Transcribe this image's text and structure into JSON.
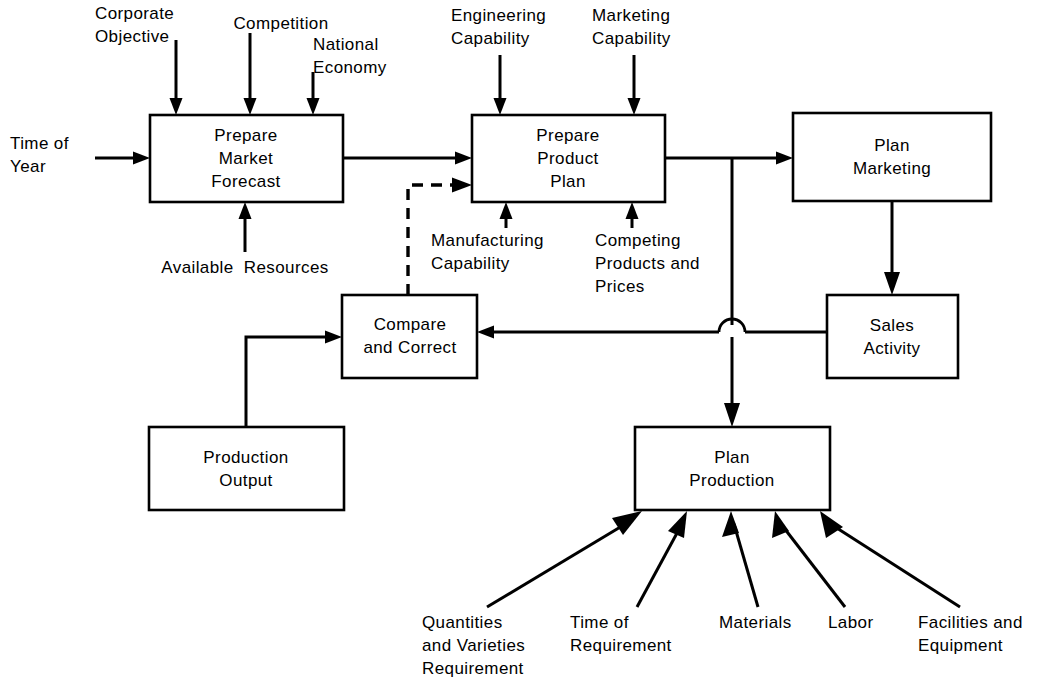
{
  "diagram": {
    "type": "flowchart",
    "stroke_color": "#000000",
    "background_color": "#ffffff",
    "process_boxes": [
      {
        "id": "prepare-market-forecast",
        "label": "Prepare\nMarket\nForecast"
      },
      {
        "id": "prepare-product-plan",
        "label": "Prepare\nProduct\nPlan"
      },
      {
        "id": "plan-marketing",
        "label": "Plan\nMarketing"
      },
      {
        "id": "sales-activity",
        "label": "Sales\nActivity"
      },
      {
        "id": "compare-and-correct",
        "label": "Compare\nand Correct"
      },
      {
        "id": "production-output",
        "label": "Production\nOutput"
      },
      {
        "id": "plan-production",
        "label": "Plan\nProduction"
      }
    ],
    "input_labels": [
      {
        "id": "corporate-objective",
        "label": "Corporate\nObjective",
        "target": "prepare-market-forecast"
      },
      {
        "id": "competition",
        "label": "Competition",
        "target": "prepare-market-forecast"
      },
      {
        "id": "national-economy",
        "label": "National\nEconomy",
        "target": "prepare-market-forecast"
      },
      {
        "id": "time-of-year",
        "label": "Time of\nYear",
        "target": "prepare-market-forecast"
      },
      {
        "id": "available-resources",
        "label": "Available  Resources",
        "target": "prepare-market-forecast"
      },
      {
        "id": "engineering-capability",
        "label": "Engineering\nCapability",
        "target": "prepare-product-plan"
      },
      {
        "id": "marketing-capability",
        "label": "Marketing\nCapability",
        "target": "prepare-product-plan"
      },
      {
        "id": "manufacturing-capability",
        "label": "Manufacturing\nCapability",
        "target": "prepare-product-plan"
      },
      {
        "id": "competing-products-and-prices",
        "label": "Competing\nProducts and\nPrices",
        "target": "prepare-product-plan"
      },
      {
        "id": "quantities-and-varieties-requirement",
        "label": "Quantities\nand Varieties\nRequirement",
        "target": "plan-production"
      },
      {
        "id": "time-of-requirement",
        "label": "Time of\nRequirement",
        "target": "plan-production"
      },
      {
        "id": "materials",
        "label": "Materials",
        "target": "plan-production"
      },
      {
        "id": "labor",
        "label": "Labor",
        "target": "plan-production"
      },
      {
        "id": "facilities-and-equipment",
        "label": "Facilities and\nEquipment",
        "target": "plan-production"
      }
    ],
    "connections": [
      {
        "from": "prepare-market-forecast",
        "to": "prepare-product-plan",
        "style": "solid"
      },
      {
        "from": "prepare-product-plan",
        "to": "plan-marketing",
        "style": "solid"
      },
      {
        "from": "plan-marketing",
        "to": "sales-activity",
        "style": "solid"
      },
      {
        "from": "sales-activity",
        "to": "compare-and-correct",
        "style": "solid"
      },
      {
        "from": "prepare-product-plan",
        "to": "plan-production",
        "style": "solid"
      },
      {
        "from": "production-output",
        "to": "compare-and-correct",
        "style": "solid"
      },
      {
        "from": "compare-and-correct",
        "to": "prepare-product-plan",
        "style": "dashed"
      }
    ]
  },
  "boxes": {
    "prepare_market_forecast": {
      "line1": "Prepare",
      "line2": "Market",
      "line3": "Forecast"
    },
    "prepare_product_plan": {
      "line1": "Prepare",
      "line2": "Product",
      "line3": "Plan"
    },
    "plan_marketing": {
      "line1": "Plan",
      "line2": "Marketing"
    },
    "sales_activity": {
      "line1": "Sales",
      "line2": "Activity"
    },
    "compare_and_correct": {
      "line1": "Compare",
      "line2": "and Correct"
    },
    "production_output": {
      "line1": "Production",
      "line2": "Output"
    },
    "plan_production": {
      "line1": "Plan",
      "line2": "Production"
    }
  },
  "labels": {
    "corporate_objective": {
      "line1": "Corporate",
      "line2": "Objective"
    },
    "competition": {
      "line1": "Competition"
    },
    "national_economy": {
      "line1": "National",
      "line2": "Economy"
    },
    "time_of_year": {
      "line1": "Time of",
      "line2": "Year"
    },
    "available_resources": {
      "line1": "Available  Resources"
    },
    "engineering_capability": {
      "line1": "Engineering",
      "line2": "Capability"
    },
    "marketing_capability": {
      "line1": "Marketing",
      "line2": "Capability"
    },
    "manufacturing_capability": {
      "line1": "Manufacturing",
      "line2": "Capability"
    },
    "competing_products": {
      "line1": "Competing",
      "line2": "Products and",
      "line3": "Prices"
    },
    "quantities_varieties": {
      "line1": "Quantities",
      "line2": "and Varieties",
      "line3": "Requirement"
    },
    "time_of_requirement": {
      "line1": "Time of",
      "line2": "Requirement"
    },
    "materials": {
      "line1": "Materials"
    },
    "labor": {
      "line1": "Labor"
    },
    "facilities_equipment": {
      "line1": "Facilities and",
      "line2": "Equipment"
    }
  }
}
